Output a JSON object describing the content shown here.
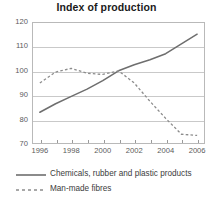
{
  "chart_data": {
    "type": "line",
    "title": "Index of production",
    "xlabel": "",
    "ylabel": "",
    "xlim": [
      1995.5,
      2006.5
    ],
    "ylim": [
      70,
      120
    ],
    "yticks": [
      70,
      80,
      90,
      100,
      110,
      120
    ],
    "xticks": [
      1996,
      1998,
      2000,
      2002,
      2004,
      2006
    ],
    "xticks_minor": [
      1997,
      1999,
      2001,
      2003,
      2005
    ],
    "grid": "horizontal",
    "legend_position": "below",
    "x": [
      1996,
      1997,
      1998,
      1999,
      2000,
      2001,
      2002,
      2003,
      2004,
      2005,
      2006
    ],
    "series": [
      {
        "name": "Chemicals, rubber and plastic products",
        "style": "solid",
        "color": "#6e6e6e",
        "values": [
          83.0,
          86.5,
          89.5,
          92.5,
          96.0,
          100.0,
          102.5,
          104.5,
          107.0,
          111.0,
          115.0
        ]
      },
      {
        "name": "Man-made fibres",
        "style": "dashed",
        "color": "#8c8c8c",
        "values": [
          95.0,
          99.5,
          101.0,
          99.0,
          98.5,
          100.0,
          95.0,
          87.5,
          80.5,
          74.0,
          73.5
        ]
      }
    ]
  },
  "legend": {
    "items": [
      {
        "label": "Chemicals, rubber and plastic products",
        "style": "solid"
      },
      {
        "label": "Man-made fibres",
        "style": "dashed"
      }
    ]
  },
  "colors": {
    "solid_series": "#6e6e6e",
    "dashed_series": "#8c8c8c",
    "grid": "#c9c9c9",
    "frame": "#b9b9b9",
    "tick_text": "#5b5b5b",
    "title_text": "#1a1a1a"
  }
}
